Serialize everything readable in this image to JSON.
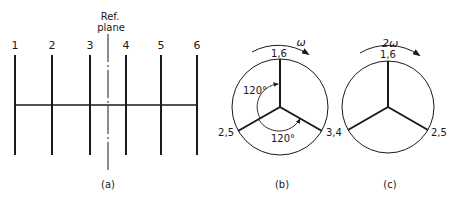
{
  "panel_a": {
    "caption": "(a)",
    "ref_plane_label_line1": "Ref.",
    "ref_plane_label_line2": "plane",
    "cranks": [
      {
        "label": "1",
        "x": 15
      },
      {
        "label": "2",
        "x": 52
      },
      {
        "label": "3",
        "x": 90
      },
      {
        "label": "4",
        "x": 126
      },
      {
        "label": "5",
        "x": 161
      },
      {
        "label": "6",
        "x": 197
      }
    ]
  },
  "panel_b": {
    "caption": "(b)",
    "rotation_label": "ω",
    "angle_label_1": "120°",
    "angle_label_2": "120°",
    "spoke_labels": {
      "top": "1,6",
      "left": "2,5",
      "right": "3,4"
    }
  },
  "panel_c": {
    "caption": "(c)",
    "rotation_label": "2ω",
    "spoke_labels": {
      "top": "1,6",
      "left": "3,4",
      "right": "2,5"
    }
  },
  "colors": {
    "ink": "#1a1a1a",
    "background": "#ffffff"
  }
}
